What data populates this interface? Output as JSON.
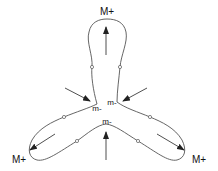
{
  "diagram": {
    "type": "three-lobed closed curve with force arrows",
    "colors": {
      "curve": "#555555",
      "arrow": "#222222",
      "text": "#111111",
      "background": "#ffffff"
    },
    "labels": {
      "top_max": "M+",
      "bottom_left_max": "M+",
      "bottom_right_max": "M+",
      "min_right": "m-",
      "min_left": "m-",
      "min_bottom": "m-"
    }
  }
}
